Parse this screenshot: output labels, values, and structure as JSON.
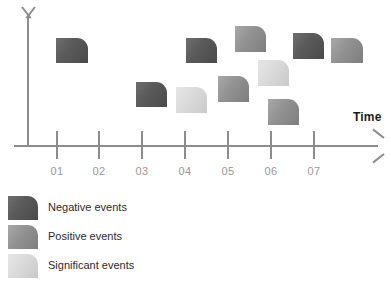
{
  "chart_data": {
    "type": "scatter",
    "title": "",
    "xlabel": "Time",
    "ylabel": "",
    "grid": false,
    "legend_position": "bottom-left",
    "categories": [
      "01",
      "02",
      "03",
      "04",
      "05",
      "06",
      "07"
    ],
    "axis": {
      "x_tick_labels": [
        "01",
        "02",
        "03",
        "04",
        "05",
        "06",
        "07"
      ],
      "x_axis_label": "Time",
      "y_axis_label": "",
      "y_tick_labels": []
    },
    "series": [
      {
        "name": "Negative events",
        "color": "#5a5a5a",
        "points": [
          {
            "x": "01",
            "y": 3,
            "px": 56,
            "py": 38,
            "w": 32,
            "h": 25
          },
          {
            "x": "03",
            "y": 2,
            "px": 136,
            "py": 82,
            "w": 31,
            "h": 25
          },
          {
            "x": "05",
            "y": 3,
            "px": 186,
            "py": 38,
            "w": 31,
            "h": 25
          },
          {
            "x": "07",
            "y": 3,
            "px": 293,
            "py": 33,
            "w": 31,
            "h": 26
          }
        ]
      },
      {
        "name": "Positive events",
        "color": "#919191",
        "points": [
          {
            "x": "05",
            "y": 4,
            "px": 235,
            "py": 26,
            "w": 31,
            "h": 26
          },
          {
            "x": "05",
            "y": 2,
            "px": 218,
            "py": 76,
            "w": 31,
            "h": 26
          },
          {
            "x": "06",
            "y": 1,
            "px": 268,
            "py": 99,
            "w": 31,
            "h": 26
          },
          {
            "x": "07",
            "y": 3,
            "px": 331,
            "py": 38,
            "w": 32,
            "h": 25
          }
        ]
      },
      {
        "name": "Significant events",
        "color": "#dadada",
        "points": [
          {
            "x": "04",
            "y": 2,
            "px": 176,
            "py": 87,
            "w": 31,
            "h": 26
          },
          {
            "x": "06",
            "y": 3,
            "px": 258,
            "py": 60,
            "w": 31,
            "h": 26
          }
        ]
      }
    ]
  },
  "axis": {
    "time_label": "Time",
    "ticks": [
      {
        "label": "01",
        "x": 57
      },
      {
        "label": "02",
        "x": 99
      },
      {
        "label": "03",
        "x": 142
      },
      {
        "label": "04",
        "x": 185
      },
      {
        "label": "05",
        "x": 228
      },
      {
        "label": "06",
        "x": 271
      },
      {
        "label": "07",
        "x": 314
      }
    ]
  },
  "legend": {
    "items": [
      {
        "label": "Negative events",
        "kind": "neg",
        "color": "#5a5a5a"
      },
      {
        "label": "Positive events",
        "kind": "pos",
        "color": "#919191"
      },
      {
        "label": "Significant events",
        "kind": "sig",
        "color": "#dadada"
      }
    ]
  },
  "events": [
    {
      "kind": "neg",
      "x": 56,
      "y": 38,
      "w": 32,
      "h": 25
    },
    {
      "kind": "neg",
      "x": 136,
      "y": 82,
      "w": 31,
      "h": 25
    },
    {
      "kind": "sig",
      "x": 176,
      "y": 87,
      "w": 31,
      "h": 26
    },
    {
      "kind": "neg",
      "x": 186,
      "y": 38,
      "w": 31,
      "h": 25
    },
    {
      "kind": "pos",
      "x": 235,
      "y": 26,
      "w": 31,
      "h": 26
    },
    {
      "kind": "pos",
      "x": 218,
      "y": 76,
      "w": 31,
      "h": 26
    },
    {
      "kind": "sig",
      "x": 258,
      "y": 60,
      "w": 31,
      "h": 26
    },
    {
      "kind": "pos",
      "x": 268,
      "y": 99,
      "w": 31,
      "h": 26
    },
    {
      "kind": "neg",
      "x": 293,
      "y": 33,
      "w": 31,
      "h": 26
    },
    {
      "kind": "pos",
      "x": 331,
      "y": 38,
      "w": 32,
      "h": 25
    }
  ]
}
